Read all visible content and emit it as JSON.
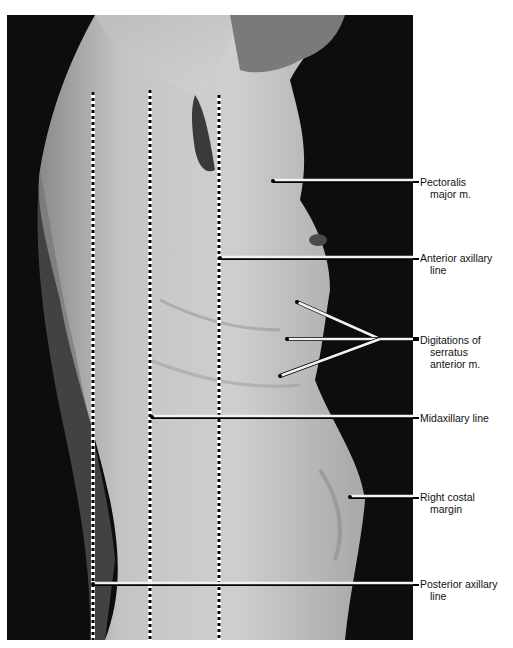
{
  "figure": {
    "reference_lines": [
      {
        "id": "posterior-axillary",
        "x": 93,
        "top": 92
      },
      {
        "id": "midaxillary",
        "x": 150,
        "top": 90
      },
      {
        "id": "anterior-axillary",
        "x": 219,
        "top": 95
      }
    ],
    "labels": [
      {
        "id": "pectoralis",
        "lines": [
          "Pectoralis",
          "major m."
        ],
        "y": 176,
        "pointer": {
          "x1": 273,
          "y1": 181,
          "x2": 413,
          "y2": 181
        }
      },
      {
        "id": "anterior-axillary",
        "lines": [
          "Anterior axillary",
          "line"
        ],
        "y": 252,
        "pointer": {
          "x1": 220,
          "y1": 258,
          "x2": 413,
          "y2": 258
        }
      },
      {
        "id": "serratus",
        "lines": [
          "Digitations of",
          "serratus",
          "anterior m."
        ],
        "y": 334
      },
      {
        "id": "midaxillary",
        "lines": [
          "Midaxillary line"
        ],
        "y": 412,
        "pointer": {
          "x1": 152,
          "y1": 417,
          "x2": 413,
          "y2": 417
        }
      },
      {
        "id": "costal-margin",
        "lines": [
          "Right costal",
          "margin"
        ],
        "y": 491,
        "pointer": {
          "x1": 350,
          "y1": 497,
          "x2": 413,
          "y2": 497
        }
      },
      {
        "id": "posterior-axillary",
        "lines": [
          "Posterior axillary",
          "line"
        ],
        "y": 578,
        "pointer": {
          "x1": 93,
          "y1": 584,
          "x2": 413,
          "y2": 584
        }
      }
    ],
    "serratus_pointers": {
      "origins": [
        [
          297,
          302
        ],
        [
          287,
          339
        ],
        [
          280,
          376
        ]
      ],
      "apex": [
        380,
        339
      ]
    }
  }
}
